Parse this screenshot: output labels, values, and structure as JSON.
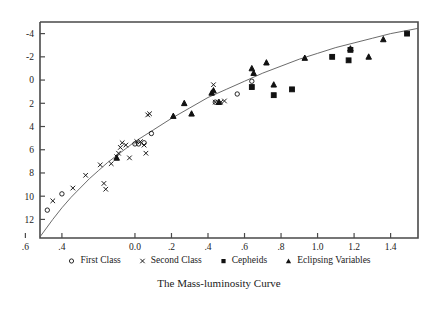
{
  "caption": "The Mass-luminosity Curve",
  "legend": {
    "items": [
      {
        "label": "First Class",
        "marker": "circle-open-marker",
        "icon": "circle-icon"
      },
      {
        "label": "Second Class",
        "marker": "cross-marker",
        "icon": "x-icon"
      },
      {
        "label": "Cepheids",
        "marker": "square-filled-marker",
        "icon": "square-icon"
      },
      {
        "label": "Eclipsing Variables",
        "marker": "triangle-filled-marker",
        "icon": "triangle-icon"
      }
    ]
  },
  "chart_data": {
    "type": "scatter",
    "title": "The Mass-luminosity Curve",
    "xlabel": "",
    "ylabel": "",
    "grid": false,
    "legend_position": "below",
    "xlim": [
      -0.52,
      1.55
    ],
    "ylim": [
      -5.0,
      13.6
    ],
    "y_inverted": true,
    "xticks": [
      -0.4,
      -0.6,
      -0.8,
      0.0,
      0.2,
      0.4,
      0.6,
      0.8,
      1.0,
      1.2,
      1.4
    ],
    "xtick_labels": [
      ".4",
      ".6",
      ".8",
      "0.0",
      ".2",
      ".4",
      ".6",
      ".8",
      "1.0",
      "1.2",
      "1.4"
    ],
    "xtick_values": [
      -0.4,
      -0.6,
      -0.8,
      0.0,
      0.2,
      0.4,
      0.6,
      0.8,
      1.0,
      1.2,
      1.4
    ],
    "yticks": [
      -4,
      -2,
      0,
      2,
      4,
      6,
      8,
      10,
      12
    ],
    "ytick_labels": [
      "-4",
      "-2",
      "0",
      "2",
      "4",
      "6",
      "8",
      "10",
      "12"
    ],
    "series": [
      {
        "name": "First Class",
        "marker": "circle-open",
        "points": [
          [
            -0.48,
            11.2
          ],
          [
            -0.4,
            9.8
          ],
          [
            0.0,
            5.5
          ],
          [
            0.02,
            5.5
          ],
          [
            0.05,
            5.4
          ],
          [
            0.09,
            4.6
          ],
          [
            0.44,
            1.9
          ],
          [
            0.56,
            1.2
          ],
          [
            0.64,
            0.1
          ]
        ]
      },
      {
        "name": "Second Class",
        "marker": "cross",
        "points": [
          [
            -0.45,
            10.4
          ],
          [
            -0.34,
            9.3
          ],
          [
            -0.27,
            8.2
          ],
          [
            -0.19,
            7.3
          ],
          [
            -0.17,
            8.9
          ],
          [
            -0.16,
            9.4
          ],
          [
            -0.13,
            7.2
          ],
          [
            -0.1,
            6.6
          ],
          [
            -0.09,
            6.3
          ],
          [
            -0.08,
            5.8
          ],
          [
            -0.07,
            5.4
          ],
          [
            -0.05,
            5.6
          ],
          [
            -0.03,
            6.7
          ],
          [
            0.01,
            5.3
          ],
          [
            0.03,
            5.3
          ],
          [
            0.05,
            5.6
          ],
          [
            0.06,
            6.3
          ],
          [
            0.07,
            3.0
          ],
          [
            0.08,
            2.9
          ],
          [
            0.43,
            0.4
          ],
          [
            0.44,
            1.9
          ],
          [
            0.47,
            1.9
          ],
          [
            0.49,
            1.8
          ]
        ]
      },
      {
        "name": "Cepheids",
        "marker": "square-filled",
        "points": [
          [
            0.64,
            0.6
          ],
          [
            0.76,
            1.3
          ],
          [
            0.86,
            0.8
          ],
          [
            1.08,
            -2.0
          ],
          [
            1.17,
            -1.7
          ],
          [
            1.18,
            -2.6
          ],
          [
            1.49,
            -4.0
          ]
        ]
      },
      {
        "name": "Eclipsing Variables",
        "marker": "triangle-filled",
        "points": [
          [
            -0.1,
            6.7
          ],
          [
            0.21,
            3.1
          ],
          [
            0.27,
            2.0
          ],
          [
            0.31,
            2.9
          ],
          [
            0.42,
            1.1
          ],
          [
            0.43,
            0.9
          ],
          [
            0.46,
            1.9
          ],
          [
            0.64,
            -1.0
          ],
          [
            0.65,
            -0.6
          ],
          [
            0.72,
            -1.5
          ],
          [
            0.76,
            0.4
          ],
          [
            0.93,
            -1.9
          ],
          [
            1.18,
            -2.7
          ],
          [
            1.28,
            -2.0
          ],
          [
            1.36,
            -3.5
          ]
        ]
      }
    ],
    "fit_curve": {
      "name": "mass-luminosity relation",
      "description": "smooth monotonic fitted curve from lower-left to upper-right",
      "points": [
        [
          -0.52,
          13.5
        ],
        [
          -0.45,
          12.0
        ],
        [
          -0.4,
          11.0
        ],
        [
          -0.35,
          10.1
        ],
        [
          -0.3,
          9.3
        ],
        [
          -0.25,
          8.5
        ],
        [
          -0.2,
          7.8
        ],
        [
          -0.15,
          7.1
        ],
        [
          -0.1,
          6.5
        ],
        [
          -0.05,
          5.9
        ],
        [
          0.0,
          5.3
        ],
        [
          0.05,
          4.8
        ],
        [
          0.1,
          4.3
        ],
        [
          0.2,
          3.3
        ],
        [
          0.3,
          2.4
        ],
        [
          0.4,
          1.5
        ],
        [
          0.5,
          0.8
        ],
        [
          0.6,
          0.1
        ],
        [
          0.7,
          -0.6
        ],
        [
          0.8,
          -1.2
        ],
        [
          0.9,
          -1.8
        ],
        [
          1.0,
          -2.3
        ],
        [
          1.1,
          -2.8
        ],
        [
          1.2,
          -3.2
        ],
        [
          1.3,
          -3.6
        ],
        [
          1.4,
          -4.0
        ],
        [
          1.5,
          -4.3
        ],
        [
          1.55,
          -4.45
        ]
      ]
    }
  }
}
